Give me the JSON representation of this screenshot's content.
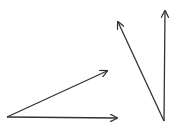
{
  "diagram": {
    "stroke_color": "#333333",
    "background": "#ffffff",
    "angles": [
      {
        "name": "acute-angle-left",
        "vertex": [
          7,
          117
        ],
        "rays": [
          {
            "name": "upper-ray",
            "end": [
              107,
              71
            ]
          },
          {
            "name": "horizontal-ray",
            "end": [
              117,
              118
            ]
          }
        ]
      },
      {
        "name": "acute-angle-right",
        "vertex": [
          164,
          121
        ],
        "rays": [
          {
            "name": "slanted-ray",
            "end": [
              118,
              22
            ]
          },
          {
            "name": "vertical-ray",
            "end": [
              165,
              11
            ]
          }
        ]
      }
    ]
  }
}
